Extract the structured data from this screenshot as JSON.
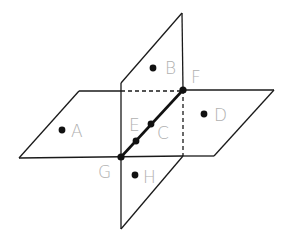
{
  "diagram": {
    "colors": {
      "line": "#1a1a1a",
      "label": "#b0b0b0",
      "point": "#111111"
    },
    "points": {
      "A": {
        "label": "A"
      },
      "B": {
        "label": "B"
      },
      "C": {
        "label": "C"
      },
      "D": {
        "label": "D"
      },
      "E": {
        "label": "E"
      },
      "F": {
        "label": "F"
      },
      "G": {
        "label": "G"
      },
      "H": {
        "label": "H"
      }
    },
    "intersection_line": "GF",
    "planes": [
      "horizontal plane containing A, D",
      "vertical plane containing B, H"
    ]
  }
}
